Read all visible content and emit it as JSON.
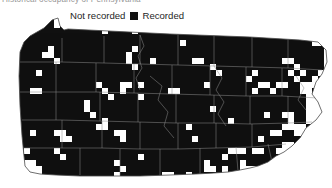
{
  "caption": {
    "text": "Historical occupancy of Pennsylvania"
  },
  "legend": {
    "not_recorded": {
      "label": "Not recorded",
      "swatch_color": "#ffffff",
      "icon": "white-square-swatch"
    },
    "recorded": {
      "label": "Recorded",
      "swatch_color": "#111111",
      "icon": "black-square-swatch"
    }
  },
  "map": {
    "region": "Pennsylvania",
    "boundary_color": "#555555",
    "county_border_color": "#8a8a8a",
    "recorded_fill": "#101010",
    "not_recorded_fill": "#ffffff",
    "grid_cell_px": 6
  },
  "chart_data": {
    "type": "heatmap",
    "title": "Historical occupancy of Pennsylvania",
    "xlabel": "",
    "ylabel": "",
    "legend_position": "top",
    "categories": [
      "Not recorded",
      "Recorded"
    ],
    "values": [
      0,
      1
    ],
    "grid_cols": 54,
    "grid_rows": 28,
    "cell_size_px": 6,
    "recorded_cells": [
      [
        3,
        2
      ],
      [
        4,
        2
      ],
      [
        5,
        2
      ],
      [
        6,
        2
      ],
      [
        7,
        2
      ],
      [
        9,
        2
      ],
      [
        10,
        2
      ],
      [
        13,
        2
      ],
      [
        16,
        2
      ],
      [
        20,
        2
      ],
      [
        21,
        2
      ],
      [
        24,
        2
      ],
      [
        25,
        2
      ],
      [
        29,
        2
      ],
      [
        33,
        2
      ],
      [
        38,
        2
      ],
      [
        39,
        2
      ],
      [
        43,
        2
      ],
      [
        46,
        2
      ],
      [
        47,
        2
      ],
      [
        2,
        3
      ],
      [
        3,
        3
      ],
      [
        4,
        3
      ],
      [
        5,
        3
      ],
      [
        6,
        3
      ],
      [
        7,
        3
      ],
      [
        8,
        3
      ],
      [
        11,
        3
      ],
      [
        12,
        3
      ],
      [
        15,
        3
      ],
      [
        19,
        3
      ],
      [
        22,
        3
      ],
      [
        26,
        3
      ],
      [
        30,
        3
      ],
      [
        31,
        3
      ],
      [
        36,
        3
      ],
      [
        40,
        3
      ],
      [
        44,
        3
      ],
      [
        45,
        3
      ],
      [
        48,
        3
      ],
      [
        2,
        4
      ],
      [
        3,
        4
      ],
      [
        4,
        4
      ],
      [
        5,
        4
      ],
      [
        6,
        4
      ],
      [
        8,
        4
      ],
      [
        9,
        4
      ],
      [
        13,
        4
      ],
      [
        14,
        4
      ],
      [
        18,
        4
      ],
      [
        23,
        4
      ],
      [
        27,
        4
      ],
      [
        32,
        4
      ],
      [
        35,
        4
      ],
      [
        37,
        4
      ],
      [
        41,
        4
      ],
      [
        42,
        4
      ],
      [
        46,
        4
      ],
      [
        49,
        4
      ],
      [
        1,
        5
      ],
      [
        2,
        5
      ],
      [
        3,
        5
      ],
      [
        5,
        5
      ],
      [
        7,
        5
      ],
      [
        10,
        5
      ],
      [
        12,
        5
      ],
      [
        16,
        5
      ],
      [
        17,
        5
      ],
      [
        21,
        5
      ],
      [
        24,
        5
      ],
      [
        28,
        5
      ],
      [
        33,
        5
      ],
      [
        34,
        5
      ],
      [
        38,
        5
      ],
      [
        43,
        5
      ],
      [
        47,
        5
      ],
      [
        50,
        5
      ],
      [
        1,
        6
      ],
      [
        3,
        6
      ],
      [
        4,
        6
      ],
      [
        6,
        6
      ],
      [
        9,
        6
      ],
      [
        11,
        6
      ],
      [
        15,
        6
      ],
      [
        19,
        6
      ],
      [
        20,
        6
      ],
      [
        25,
        6
      ],
      [
        29,
        6
      ],
      [
        30,
        6
      ],
      [
        35,
        6
      ],
      [
        39,
        6
      ],
      [
        44,
        6
      ],
      [
        48,
        6
      ],
      [
        51,
        6
      ],
      [
        2,
        7
      ],
      [
        4,
        7
      ],
      [
        5,
        7
      ],
      [
        8,
        7
      ],
      [
        12,
        7
      ],
      [
        13,
        7
      ],
      [
        17,
        7
      ],
      [
        22,
        7
      ],
      [
        26,
        7
      ],
      [
        31,
        7
      ],
      [
        36,
        7
      ],
      [
        40,
        7
      ],
      [
        41,
        7
      ],
      [
        45,
        7
      ],
      [
        49,
        7
      ],
      [
        1,
        8
      ],
      [
        3,
        8
      ],
      [
        6,
        8
      ],
      [
        7,
        8
      ],
      [
        10,
        8
      ],
      [
        14,
        8
      ],
      [
        18,
        8
      ],
      [
        23,
        8
      ],
      [
        27,
        8
      ],
      [
        28,
        8
      ],
      [
        32,
        8
      ],
      [
        37,
        8
      ],
      [
        42,
        8
      ],
      [
        46,
        8
      ],
      [
        50,
        8
      ],
      [
        2,
        9
      ],
      [
        4,
        9
      ],
      [
        5,
        9
      ],
      [
        9,
        9
      ],
      [
        11,
        9
      ],
      [
        15,
        9
      ],
      [
        16,
        9
      ],
      [
        20,
        9
      ],
      [
        24,
        9
      ],
      [
        33,
        9
      ],
      [
        38,
        9
      ],
      [
        43,
        9
      ],
      [
        47,
        9
      ],
      [
        1,
        10
      ],
      [
        3,
        10
      ],
      [
        7,
        10
      ],
      [
        8,
        10
      ],
      [
        12,
        10
      ],
      [
        17,
        10
      ],
      [
        21,
        10
      ],
      [
        25,
        10
      ],
      [
        29,
        10
      ],
      [
        34,
        10
      ],
      [
        39,
        10
      ],
      [
        44,
        10
      ],
      [
        48,
        10
      ],
      [
        2,
        11
      ],
      [
        5,
        11
      ],
      [
        6,
        11
      ],
      [
        10,
        11
      ],
      [
        13,
        11
      ],
      [
        18,
        11
      ],
      [
        22,
        11
      ],
      [
        26,
        11
      ],
      [
        30,
        11
      ],
      [
        35,
        11
      ],
      [
        40,
        11
      ],
      [
        45,
        11
      ],
      [
        1,
        12
      ],
      [
        4,
        12
      ],
      [
        8,
        12
      ],
      [
        11,
        12
      ],
      [
        14,
        12
      ],
      [
        19,
        12
      ],
      [
        23,
        12
      ],
      [
        27,
        12
      ],
      [
        31,
        12
      ],
      [
        36,
        12
      ],
      [
        41,
        12
      ],
      [
        46,
        12
      ],
      [
        2,
        13
      ],
      [
        3,
        13
      ],
      [
        7,
        13
      ],
      [
        9,
        13
      ],
      [
        15,
        13
      ],
      [
        20,
        13
      ],
      [
        24,
        13
      ],
      [
        28,
        13
      ],
      [
        32,
        13
      ],
      [
        37,
        13
      ],
      [
        42,
        13
      ],
      [
        47,
        13
      ],
      [
        1,
        14
      ],
      [
        5,
        14
      ],
      [
        6,
        14
      ],
      [
        10,
        14
      ],
      [
        16,
        14
      ],
      [
        21,
        14
      ],
      [
        25,
        14
      ],
      [
        29,
        14
      ],
      [
        33,
        14
      ],
      [
        38,
        14
      ],
      [
        43,
        14
      ],
      [
        2,
        15
      ],
      [
        4,
        15
      ],
      [
        8,
        15
      ],
      [
        12,
        15
      ],
      [
        17,
        15
      ],
      [
        22,
        15
      ],
      [
        26,
        15
      ],
      [
        30,
        15
      ],
      [
        34,
        15
      ],
      [
        39,
        15
      ],
      [
        44,
        15
      ],
      [
        3,
        16
      ],
      [
        7,
        16
      ],
      [
        11,
        16
      ],
      [
        13,
        16
      ],
      [
        18,
        16
      ],
      [
        23,
        16
      ],
      [
        27,
        16
      ],
      [
        31,
        16
      ],
      [
        35,
        16
      ],
      [
        40,
        16
      ],
      [
        45,
        16
      ],
      [
        1,
        17
      ],
      [
        5,
        17
      ],
      [
        9,
        17
      ],
      [
        14,
        17
      ],
      [
        19,
        17
      ],
      [
        24,
        17
      ],
      [
        28,
        17
      ],
      [
        32,
        17
      ],
      [
        36,
        17
      ],
      [
        41,
        17
      ],
      [
        2,
        18
      ],
      [
        6,
        18
      ],
      [
        10,
        18
      ],
      [
        15,
        18
      ],
      [
        20,
        18
      ],
      [
        25,
        18
      ],
      [
        29,
        18
      ],
      [
        33,
        18
      ],
      [
        37,
        18
      ],
      [
        42,
        18
      ],
      [
        3,
        19
      ],
      [
        7,
        19
      ],
      [
        11,
        19
      ],
      [
        16,
        19
      ],
      [
        21,
        19
      ],
      [
        26,
        19
      ],
      [
        30,
        19
      ],
      [
        34,
        19
      ],
      [
        38,
        19
      ],
      [
        43,
        19
      ],
      [
        4,
        20
      ],
      [
        8,
        20
      ],
      [
        12,
        20
      ],
      [
        17,
        20
      ],
      [
        22,
        20
      ],
      [
        27,
        20
      ],
      [
        31,
        20
      ],
      [
        35,
        20
      ],
      [
        39,
        20
      ],
      [
        5,
        21
      ],
      [
        9,
        21
      ],
      [
        13,
        21
      ],
      [
        18,
        21
      ],
      [
        23,
        21
      ],
      [
        28,
        21
      ],
      [
        32,
        21
      ],
      [
        36,
        21
      ],
      [
        40,
        21
      ],
      [
        6,
        22
      ],
      [
        10,
        22
      ],
      [
        14,
        22
      ],
      [
        19,
        22
      ],
      [
        24,
        22
      ],
      [
        29,
        22
      ],
      [
        33,
        22
      ],
      [
        37,
        22
      ],
      [
        7,
        23
      ],
      [
        11,
        23
      ],
      [
        15,
        23
      ],
      [
        20,
        23
      ],
      [
        25,
        23
      ],
      [
        30,
        23
      ],
      [
        34,
        23
      ],
      [
        8,
        24
      ],
      [
        12,
        24
      ],
      [
        16,
        24
      ],
      [
        21,
        24
      ],
      [
        26,
        24
      ],
      [
        31,
        24
      ],
      [
        9,
        25
      ],
      [
        13,
        25
      ],
      [
        17,
        25
      ],
      [
        22,
        25
      ],
      [
        27,
        25
      ],
      [
        10,
        26
      ],
      [
        14,
        26
      ],
      [
        18,
        26
      ],
      [
        23,
        26
      ]
    ]
  }
}
